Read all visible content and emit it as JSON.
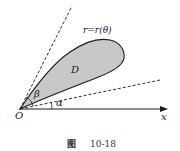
{
  "figure": {
    "curve_label": "r=r(θ)",
    "region_label": "D",
    "angle_alpha_label": "α",
    "angle_beta_label": "β",
    "origin_label": "O",
    "x_axis_label": "x",
    "caption_prefix": "图",
    "caption_number": "10-18",
    "colors": {
      "region_fill": "#c8c8c8",
      "stroke": "#1a1a1a",
      "background": "#ffffff"
    }
  }
}
